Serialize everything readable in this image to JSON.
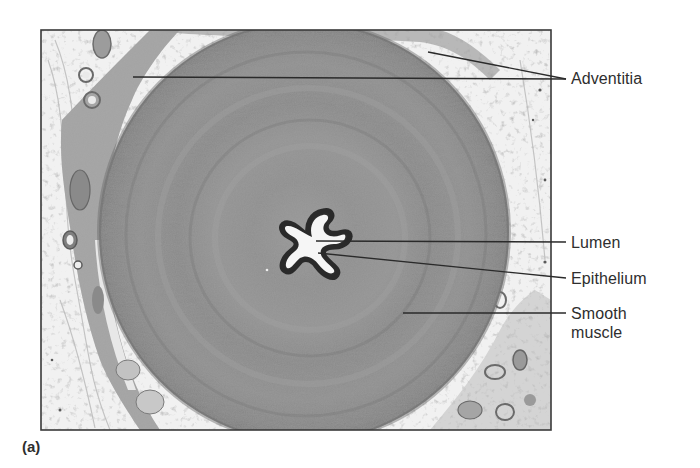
{
  "figure": {
    "panel_label": "(a)",
    "image_description": "Light micrograph cross-section of a tubular organ (ductus deferens) showing a thick circular smooth muscle wall, a small star-shaped lumen lined by epithelium, and outer adventitia",
    "labels": {
      "adventitia": "Adventitia",
      "lumen": "Lumen",
      "epithelium": "Epithelium",
      "smooth_muscle_line1": "Smooth",
      "smooth_muscle_line2": "muscle"
    },
    "colors": {
      "text": "#2e2e2e",
      "leader_line": "#2a2a2a",
      "frame": "#3a3a3a",
      "background_tissue": "#f1f1f1",
      "smooth_muscle": "#8c8c8c",
      "epithelium": "#3c3c3c",
      "lumen": "#f4f4f4"
    }
  }
}
